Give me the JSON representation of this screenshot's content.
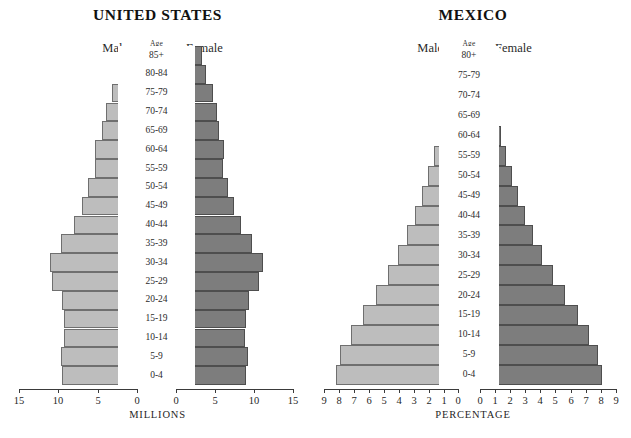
{
  "caption": "",
  "colors": {
    "male_bar": "#bdbdbd",
    "female_bar": "#7d7d7d",
    "male_border": "#6f6f6f",
    "female_border": "#4e4e4e",
    "axis": "#3a3a3a",
    "background": "#ffffff"
  },
  "panels": [
    {
      "id": "us",
      "title": "UNITED STATES",
      "male_label": "Male",
      "female_label": "Female",
      "age_head": "Age"
    },
    {
      "id": "mx",
      "title": "MEXICO",
      "male_label": "Male",
      "female_label": "Female",
      "age_head": "Age"
    }
  ],
  "chart_data": [
    {
      "type": "bar",
      "subtype": "population-pyramid",
      "title": "UNITED STATES",
      "xlabel": "MILLIONS",
      "ylabel": "Age",
      "xlim": [
        0,
        15
      ],
      "xticks": [
        15,
        10,
        5,
        0,
        0,
        5,
        10,
        15
      ],
      "left_ticks": [
        "15",
        "10",
        "5",
        "0"
      ],
      "right_ticks": [
        "0",
        "5",
        "10",
        "15"
      ],
      "grid": false,
      "legend": [
        "Male",
        "Female"
      ],
      "legend_position": "top",
      "categories": [
        "85+",
        "80-84",
        "75-79",
        "70-74",
        "65-69",
        "60-64",
        "55-59",
        "50-54",
        "45-49",
        "40-44",
        "35-39",
        "30-34",
        "25-29",
        "20-24",
        "15-19",
        "10-14",
        "5-9",
        "0-4"
      ],
      "series": [
        {
          "name": "Male",
          "side": "left",
          "values": [
            1.5,
            2.2,
            3.2,
            4.0,
            4.5,
            5.3,
            5.4,
            6.2,
            7.0,
            8.0,
            9.6,
            11.0,
            10.8,
            9.5,
            9.3,
            9.3,
            9.7,
            9.5
          ]
        },
        {
          "name": "Female",
          "side": "right",
          "values": [
            3.3,
            3.8,
            4.8,
            5.3,
            5.5,
            6.1,
            6.0,
            6.7,
            7.4,
            8.3,
            9.7,
            11.2,
            10.7,
            9.3,
            9.0,
            8.9,
            9.2,
            9.0
          ]
        }
      ]
    },
    {
      "type": "bar",
      "subtype": "population-pyramid",
      "title": "MEXICO",
      "xlabel": "PERCENTAGE",
      "ylabel": "Age",
      "xlim": [
        0,
        9
      ],
      "xticks": [
        9,
        8,
        7,
        6,
        5,
        4,
        3,
        2,
        1,
        0,
        0,
        1,
        2,
        3,
        4,
        5,
        6,
        7,
        8,
        9
      ],
      "left_ticks": [
        "9",
        "8",
        "7",
        "6",
        "5",
        "4",
        "3",
        "2",
        "1",
        "0"
      ],
      "right_ticks": [
        "0",
        "1",
        "2",
        "3",
        "4",
        "5",
        "6",
        "7",
        "8",
        "9"
      ],
      "grid": false,
      "legend": [
        "Male",
        "Female"
      ],
      "legend_position": "top",
      "categories": [
        "80+",
        "75-79",
        "70-74",
        "65-69",
        "60-64",
        "55-59",
        "50-54",
        "45-49",
        "40-44",
        "35-39",
        "30-34",
        "25-29",
        "20-24",
        "15-19",
        "10-14",
        "5-9",
        "0-4"
      ],
      "series": [
        {
          "name": "Male",
          "side": "left",
          "values": [
            0.45,
            0.5,
            0.8,
            1.0,
            1.3,
            1.6,
            2.0,
            2.4,
            2.9,
            3.4,
            4.0,
            4.7,
            5.5,
            6.4,
            7.2,
            7.9,
            8.2
          ]
        },
        {
          "name": "Female",
          "side": "right",
          "values": [
            0.5,
            0.55,
            0.85,
            1.1,
            1.4,
            1.7,
            2.1,
            2.5,
            3.0,
            3.5,
            4.1,
            4.8,
            5.6,
            6.5,
            7.2,
            7.8,
            8.1
          ]
        }
      ]
    }
  ]
}
